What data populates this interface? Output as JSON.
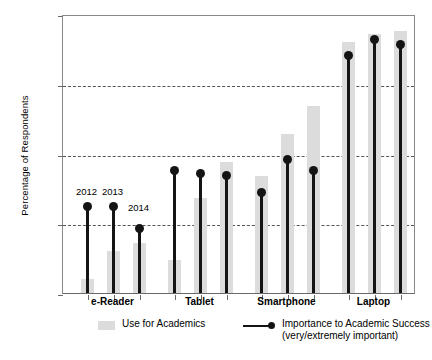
{
  "chart_data": {
    "type": "bar",
    "title": "",
    "xlabel": "",
    "ylabel": "Percentage of Respondents",
    "ylim": [
      0,
      100
    ],
    "ytick_labels": [
      "0%",
      "25%",
      "50%",
      "75%",
      "100%"
    ],
    "ytick_values": [
      0,
      25,
      50,
      75,
      100
    ],
    "gridlines_at": [
      25,
      50,
      75
    ],
    "grid": true,
    "legend_position": "bottom",
    "categories": [
      "e-Reader",
      "Tablet",
      "Smartphone",
      "Laptop"
    ],
    "years": [
      "2012",
      "2013",
      "2014"
    ],
    "series": [
      {
        "name": "Use for Academics",
        "render": "bar",
        "color": "#dcdcdc",
        "values": [
          [
            5,
            15,
            18
          ],
          [
            12,
            34,
            47
          ],
          [
            42,
            57,
            67
          ],
          [
            90,
            93,
            94
          ]
        ]
      },
      {
        "name": "Importance to Academic Success",
        "sublabel": "(very/extremely important)",
        "render": "stem-dot",
        "color": "#141414",
        "values": [
          [
            31,
            31,
            23
          ],
          [
            44,
            43,
            42
          ],
          [
            36,
            48,
            44
          ],
          [
            85,
            91,
            89
          ]
        ]
      }
    ],
    "annotations": [
      {
        "text": "2012",
        "category": "e-Reader",
        "year": "2012"
      },
      {
        "text": "2013",
        "category": "e-Reader",
        "year": "2013"
      },
      {
        "text": "2014",
        "category": "e-Reader",
        "year": "2014"
      }
    ]
  },
  "legend": {
    "bars_label": "Use for Academics",
    "line_label": "Importance to Academic Success",
    "line_sublabel": "(very/extremely important)"
  },
  "caption": ""
}
